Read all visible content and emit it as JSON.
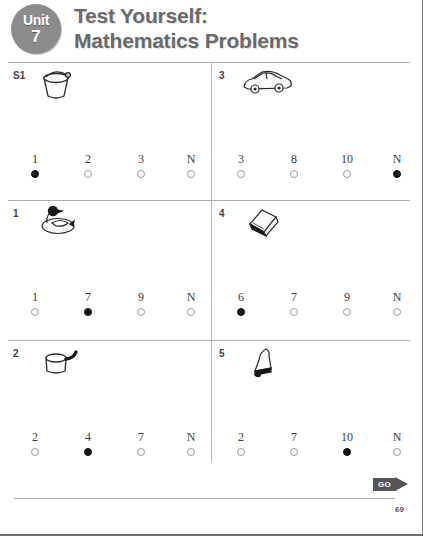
{
  "header": {
    "unit_word": "Unit",
    "unit_number": "7",
    "title_line1": "Test Yourself:",
    "title_line2": "Mathematics Problems",
    "badge_color": "#8b8b8b",
    "title_color": "#6a6a6a"
  },
  "questions": [
    {
      "number": "S1",
      "icon": "bucket-icon",
      "options": [
        {
          "label": "1",
          "selected": true
        },
        {
          "label": "2",
          "selected": false
        },
        {
          "label": "3",
          "selected": false
        },
        {
          "label": "N",
          "selected": false
        }
      ]
    },
    {
      "number": "3",
      "icon": "car-icon",
      "options": [
        {
          "label": "3",
          "selected": false
        },
        {
          "label": "8",
          "selected": false
        },
        {
          "label": "10",
          "selected": false
        },
        {
          "label": "N",
          "selected": true
        }
      ]
    },
    {
      "number": "1",
      "icon": "duck-icon",
      "options": [
        {
          "label": "1",
          "selected": false
        },
        {
          "label": "7",
          "selected": true
        },
        {
          "label": "9",
          "selected": false
        },
        {
          "label": "N",
          "selected": false
        }
      ]
    },
    {
      "number": "4",
      "icon": "book-icon",
      "options": [
        {
          "label": "6",
          "selected": true
        },
        {
          "label": "7",
          "selected": false
        },
        {
          "label": "9",
          "selected": false
        },
        {
          "label": "N",
          "selected": false
        }
      ]
    },
    {
      "number": "2",
      "icon": "saucepan-icon",
      "options": [
        {
          "label": "2",
          "selected": false
        },
        {
          "label": "4",
          "selected": true
        },
        {
          "label": "7",
          "selected": false
        },
        {
          "label": "N",
          "selected": false
        }
      ]
    },
    {
      "number": "5",
      "icon": "bell-icon",
      "options": [
        {
          "label": "2",
          "selected": false
        },
        {
          "label": "7",
          "selected": false
        },
        {
          "label": "10",
          "selected": true
        },
        {
          "label": "N",
          "selected": false
        }
      ]
    }
  ],
  "footer": {
    "go_label": "GO",
    "page_number": "69"
  }
}
